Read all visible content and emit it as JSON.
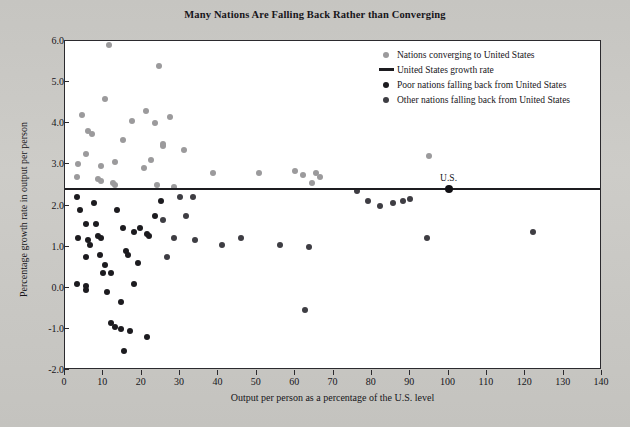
{
  "chart_data": {
    "type": "scatter",
    "title": "Many Nations Are Falling Back Rather than Converging",
    "xlabel": "Output per person as a percentage of the U.S. level",
    "ylabel": "Percentage growth rate in output per person",
    "xlim": [
      0,
      140
    ],
    "ylim": [
      -2.0,
      6.0
    ],
    "xticks": [
      0,
      10,
      20,
      30,
      40,
      50,
      60,
      70,
      80,
      90,
      100,
      110,
      120,
      130,
      140
    ],
    "yticks": [
      "-2.0",
      "-1.0",
      "0.0",
      "1.0",
      "2.0",
      "3.0",
      "4.0",
      "5.0",
      "6.0"
    ],
    "grid": false,
    "legend_position": "top-right",
    "reference_line": {
      "label": "United States growth rate",
      "y": 2.4,
      "color": "#1d1c20"
    },
    "annotations": [
      {
        "text": "U.S.",
        "x": 100,
        "y": 2.4
      }
    ],
    "legend": [
      {
        "label": "Nations converging to United States",
        "marker": "circle",
        "color": "#9b9a9c",
        "series": "converging"
      },
      {
        "label": "United States growth rate",
        "marker": "line",
        "color": "#1d1c20",
        "series": "us_line"
      },
      {
        "label": "Poor nations falling back from United States",
        "marker": "circle",
        "color": "#1c1b1f",
        "series": "poor"
      },
      {
        "label": "Other nations falling back from United States",
        "marker": "circle",
        "color": "#3e3d43",
        "series": "other"
      }
    ],
    "series": [
      {
        "name": "Nations converging to United States",
        "color": "#9b9a9c",
        "points": [
          [
            11.5,
            5.9
          ],
          [
            24.5,
            5.4
          ],
          [
            10.5,
            4.6
          ],
          [
            21.0,
            4.3
          ],
          [
            4.5,
            4.2
          ],
          [
            17.5,
            4.05
          ],
          [
            23.5,
            4.0
          ],
          [
            27.5,
            4.15
          ],
          [
            6.0,
            3.8
          ],
          [
            7.0,
            3.75
          ],
          [
            15.0,
            3.6
          ],
          [
            25.5,
            3.5
          ],
          [
            25.5,
            3.45
          ],
          [
            31.0,
            3.35
          ],
          [
            5.5,
            3.25
          ],
          [
            13.0,
            3.05
          ],
          [
            22.5,
            3.1
          ],
          [
            3.5,
            3.0
          ],
          [
            9.5,
            2.95
          ],
          [
            20.5,
            2.9
          ],
          [
            95.0,
            3.2
          ],
          [
            38.5,
            2.8
          ],
          [
            50.5,
            2.8
          ],
          [
            60.0,
            2.85
          ],
          [
            62.0,
            2.75
          ],
          [
            65.5,
            2.8
          ],
          [
            64.5,
            2.55
          ],
          [
            66.5,
            2.7
          ],
          [
            3.0,
            2.7
          ],
          [
            8.5,
            2.65
          ],
          [
            9.5,
            2.6
          ],
          [
            12.5,
            2.55
          ],
          [
            13.0,
            2.5
          ],
          [
            24.0,
            2.5
          ],
          [
            28.5,
            2.45
          ]
        ]
      },
      {
        "name": "Poor nations falling back from United States",
        "color": "#1c1b1f",
        "points": [
          [
            3.0,
            2.2
          ],
          [
            4.0,
            1.9
          ],
          [
            7.5,
            2.05
          ],
          [
            5.5,
            1.55
          ],
          [
            8.0,
            1.55
          ],
          [
            13.5,
            1.9
          ],
          [
            15.0,
            1.45
          ],
          [
            18.0,
            1.35
          ],
          [
            19.5,
            1.45
          ],
          [
            3.5,
            1.2
          ],
          [
            6.0,
            1.15
          ],
          [
            6.5,
            1.05
          ],
          [
            8.5,
            1.25
          ],
          [
            9.5,
            1.2
          ],
          [
            21.5,
            1.3
          ],
          [
            22.0,
            1.25
          ],
          [
            5.5,
            0.75
          ],
          [
            9.0,
            0.8
          ],
          [
            10.5,
            0.55
          ],
          [
            16.0,
            0.9
          ],
          [
            16.5,
            0.8
          ],
          [
            19.0,
            0.6
          ],
          [
            3.0,
            0.1
          ],
          [
            5.5,
            0.05
          ],
          [
            5.5,
            -0.05
          ],
          [
            11.0,
            -0.1
          ],
          [
            14.5,
            -0.35
          ],
          [
            18.0,
            0.1
          ],
          [
            12.0,
            -0.85
          ],
          [
            13.0,
            -0.95
          ],
          [
            14.5,
            -1.0
          ],
          [
            17.0,
            -1.05
          ],
          [
            15.5,
            -1.55
          ],
          [
            21.5,
            -1.2
          ],
          [
            10.0,
            0.35
          ],
          [
            12.0,
            0.35
          ],
          [
            25.0,
            2.1
          ],
          [
            23.5,
            1.75
          ]
        ]
      },
      {
        "name": "Other nations falling back from United States",
        "color": "#3e3d43",
        "points": [
          [
            30.0,
            2.2
          ],
          [
            33.5,
            2.2
          ],
          [
            31.5,
            1.75
          ],
          [
            28.5,
            1.2
          ],
          [
            34.0,
            1.15
          ],
          [
            41.0,
            1.05
          ],
          [
            46.0,
            1.2
          ],
          [
            56.0,
            1.05
          ],
          [
            63.5,
            1.0
          ],
          [
            62.5,
            -0.55
          ],
          [
            76.0,
            2.35
          ],
          [
            79.0,
            2.1
          ],
          [
            82.0,
            2.0
          ],
          [
            85.5,
            2.05
          ],
          [
            88.0,
            2.1
          ],
          [
            90.0,
            2.15
          ],
          [
            94.5,
            1.2
          ],
          [
            122.0,
            1.35
          ],
          [
            25.5,
            1.65
          ],
          [
            26.5,
            0.75
          ]
        ]
      }
    ]
  }
}
